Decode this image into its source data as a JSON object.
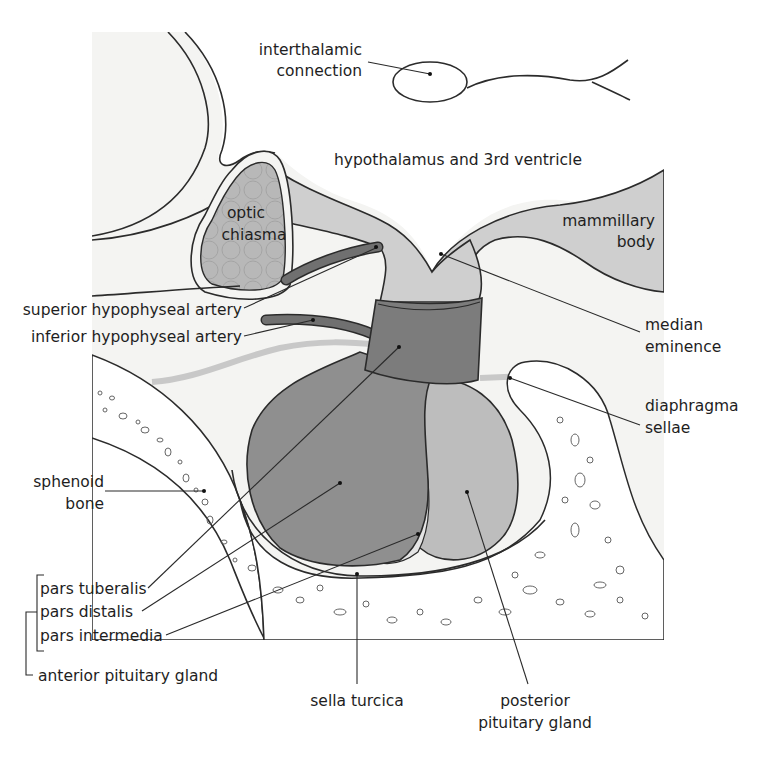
{
  "figure": {
    "colors": {
      "background": "#f4f4f2",
      "hypothalamus_stalk": "#cfcfcf",
      "anterior_lobe": "#8e8e8e",
      "pars_tuberalis_band": "#7d7d7d",
      "posterior_lobe": "#bdbdbd",
      "pars_intermedia": "#e2e2e2",
      "artery": "#6f6f6f",
      "optic_chiasma": "#b5b5b5",
      "bone": "#ffffff",
      "outline": "#2b2b2b"
    }
  },
  "labels": {
    "interthalamic_connection": [
      "interthalamic",
      "connection"
    ],
    "hypothalamus": "hypothalamus and 3rd ventricle",
    "optic_chiasma": [
      "optic",
      "chiasma"
    ],
    "mammillary_body": [
      "mammillary",
      "body"
    ],
    "superior_artery": "superior hypophyseal artery",
    "inferior_artery": "inferior hypophyseal artery",
    "median_eminence": [
      "median",
      "eminence"
    ],
    "diaphragma_sellae": [
      "diaphragma",
      "sellae"
    ],
    "sphenoid_bone": [
      "sphenoid",
      "bone"
    ],
    "pars_tuberalis": "pars tuberalis",
    "pars_distalis": "pars distalis",
    "pars_intermedia": "pars intermedia",
    "anterior_pituitary": "anterior pituitary gland",
    "sella_turcica": "sella turcica",
    "posterior_pituitary": [
      "posterior",
      "pituitary gland"
    ]
  }
}
